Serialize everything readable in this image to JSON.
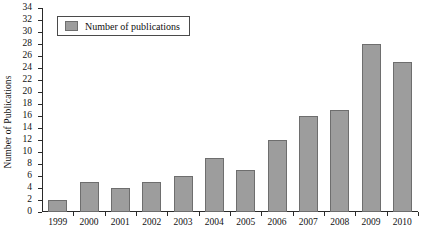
{
  "chart_data": {
    "type": "bar",
    "title": "",
    "xlabel": "",
    "ylabel": "Number of Publications",
    "categories": [
      "1999",
      "2000",
      "2001",
      "2002",
      "2003",
      "2004",
      "2005",
      "2006",
      "2007",
      "2008",
      "2009",
      "2010"
    ],
    "values": [
      2,
      5,
      4,
      5,
      6,
      9,
      7,
      12,
      16,
      17,
      28,
      25
    ],
    "series": [
      {
        "name": "Number of publications",
        "values": [
          2,
          5,
          4,
          5,
          6,
          9,
          7,
          12,
          16,
          17,
          28,
          25
        ]
      }
    ],
    "ylim": [
      0,
      34
    ],
    "ytick_step": 2,
    "yticks": [
      0,
      2,
      4,
      6,
      8,
      10,
      12,
      14,
      16,
      18,
      20,
      22,
      24,
      26,
      28,
      30,
      32,
      34
    ],
    "grid": false,
    "legend": {
      "position": "top-left",
      "entries": [
        "Number of publications"
      ]
    },
    "colors": {
      "bar_fill": "#9d9d9d",
      "bar_stroke": "#6e6e6e",
      "axis": "#2a2a2a",
      "text": "#111111",
      "background": "#ffffff"
    }
  },
  "legend": {
    "label": "Number of publications"
  },
  "axes": {
    "y_title": "Number of Publications"
  }
}
